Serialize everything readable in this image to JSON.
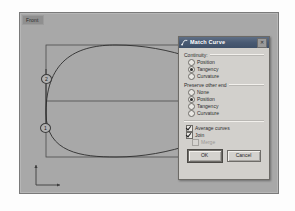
{
  "viewport": {
    "label": "Front",
    "markers": [
      {
        "id": "2",
        "label": "2"
      },
      {
        "id": "1",
        "label": "1"
      }
    ],
    "axis_gizmo": "cplane-axis-icon"
  },
  "dialog": {
    "title": "Match Curve",
    "title_icon": "match-curve-icon",
    "close_label": "✕",
    "continuity": {
      "group_label": "Continuity:",
      "options": [
        {
          "label": "Position",
          "selected": false
        },
        {
          "label": "Tangency",
          "selected": true
        },
        {
          "label": "Curvature",
          "selected": false
        }
      ]
    },
    "preserve_other_end": {
      "group_label": "Preserve other end",
      "options": [
        {
          "label": "None",
          "selected": false
        },
        {
          "label": "Position",
          "selected": true
        },
        {
          "label": "Tangency",
          "selected": false
        },
        {
          "label": "Curvature",
          "selected": false
        }
      ]
    },
    "checkboxes": [
      {
        "label": "Average curves",
        "checked": true,
        "enabled": true
      },
      {
        "label": "Join",
        "checked": true,
        "enabled": true
      },
      {
        "label": "Merge",
        "checked": false,
        "enabled": false
      }
    ],
    "buttons": {
      "ok": "OK",
      "cancel": "Cancel"
    }
  },
  "colors": {
    "viewport_background": "#a8a8a8",
    "dialog_face": "#d2d0cc",
    "title_bar": "#49597 2",
    "curve_stroke": "#2e2e2e",
    "accent": "#3f5068"
  }
}
